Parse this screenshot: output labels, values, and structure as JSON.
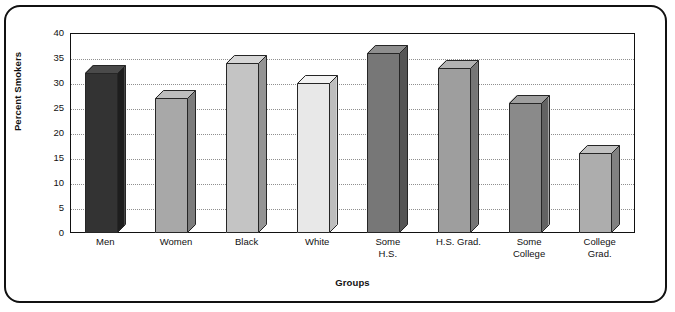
{
  "chart_data": {
    "type": "bar",
    "title": "",
    "xlabel": "Groups",
    "ylabel": "Percent Smokers",
    "ylim": [
      0,
      40
    ],
    "ytick_step": 5,
    "yticks": [
      40,
      35,
      30,
      25,
      20,
      15,
      10,
      5,
      0
    ],
    "grid": "horizontal-dotted",
    "legend": "none",
    "style": "3d-bars-grayscale",
    "categories": [
      "Men",
      "Women",
      "Black",
      "White",
      "Some\nH.S.",
      "H.S. Grad.",
      "Some\nCollege",
      "College\nGrad."
    ],
    "values": [
      32,
      27,
      34,
      30,
      36,
      33,
      26,
      16
    ],
    "bar_colors": [
      "#333333",
      "#a8a8a8",
      "#c4c4c4",
      "#e8e8e8",
      "#777777",
      "#9e9e9e",
      "#8a8a8a",
      "#adadad"
    ],
    "bar_top_colors": [
      "#4a4a4a",
      "#bdbdbd",
      "#d6d6d6",
      "#f2f2f2",
      "#8e8e8e",
      "#b2b2b2",
      "#9f9f9f",
      "#c2c2c2"
    ],
    "bar_side_colors": [
      "#1e1e1e",
      "#7c7c7c",
      "#949494",
      "#bdbdbd",
      "#555555",
      "#767676",
      "#636363",
      "#818181"
    ]
  },
  "axis": {
    "y_title": "Percent Smokers",
    "x_title": "Groups"
  }
}
